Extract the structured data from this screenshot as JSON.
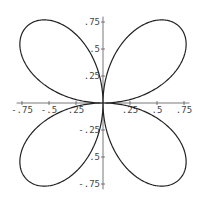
{
  "chart_data": {
    "type": "line",
    "subtype": "polar-parametric",
    "title": "",
    "equation": "r = sin(2θ)",
    "xlabel": "",
    "ylabel": "",
    "xlim": [
      -0.8,
      0.8
    ],
    "ylim": [
      -0.8,
      0.8
    ],
    "grid": false,
    "legend": null,
    "x_ticks": [
      {
        "value": -0.75,
        "label": "-.75"
      },
      {
        "value": -0.5,
        "label": "-.5"
      },
      {
        "value": -0.25,
        "label": ".25"
      },
      {
        "value": 0.25,
        "label": ".25"
      },
      {
        "value": 0.5,
        "label": ".5"
      },
      {
        "value": 0.75,
        "label": ".75"
      }
    ],
    "y_ticks": [
      {
        "value": 0.75,
        "label": ".75"
      },
      {
        "value": 0.5,
        "label": ".5"
      },
      {
        "value": 0.25,
        "label": ".25"
      },
      {
        "value": -0.25,
        "label": "-.25"
      },
      {
        "value": -0.5,
        "label": ".5"
      },
      {
        "value": -0.75,
        "label": "-.75"
      }
    ],
    "series": [
      {
        "name": "four-petal rose",
        "color": "#222222",
        "theta_range": [
          0,
          6.2832
        ],
        "samples": 720
      }
    ]
  },
  "layout": {
    "origin_px": [
      103,
      103
    ],
    "unit_px": 108,
    "axis_color": "#555555",
    "curve_color": "#222222"
  }
}
